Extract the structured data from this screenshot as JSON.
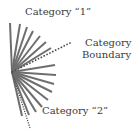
{
  "diagram": {
    "origin": [
      12,
      72
    ],
    "ray_color": "#6e6e6e",
    "dotted_color": "#4a4a4a",
    "solid_rays": [
      {
        "x": 10,
        "y": 23
      },
      {
        "x": 20,
        "y": 24
      },
      {
        "x": 27,
        "y": 27
      },
      {
        "x": 33,
        "y": 31
      },
      {
        "x": 40,
        "y": 36
      },
      {
        "x": 46,
        "y": 42
      },
      {
        "x": 51,
        "y": 48
      },
      {
        "x": 55,
        "y": 65
      },
      {
        "x": 56,
        "y": 75
      },
      {
        "x": 54,
        "y": 84
      },
      {
        "x": 52,
        "y": 92
      },
      {
        "x": 48,
        "y": 100
      },
      {
        "x": 42,
        "y": 107
      },
      {
        "x": 36,
        "y": 112
      },
      {
        "x": 29,
        "y": 115
      },
      {
        "x": 22,
        "y": 116
      }
    ],
    "boundary_ray": {
      "x": 72,
      "y": 42
    },
    "lower_dotted_ray": {
      "x": 30,
      "y": 128
    },
    "labels": {
      "category1": "Category “1”",
      "boundary_line1": "Category",
      "boundary_line2": "Boundary",
      "category2": "Category “2”"
    }
  }
}
